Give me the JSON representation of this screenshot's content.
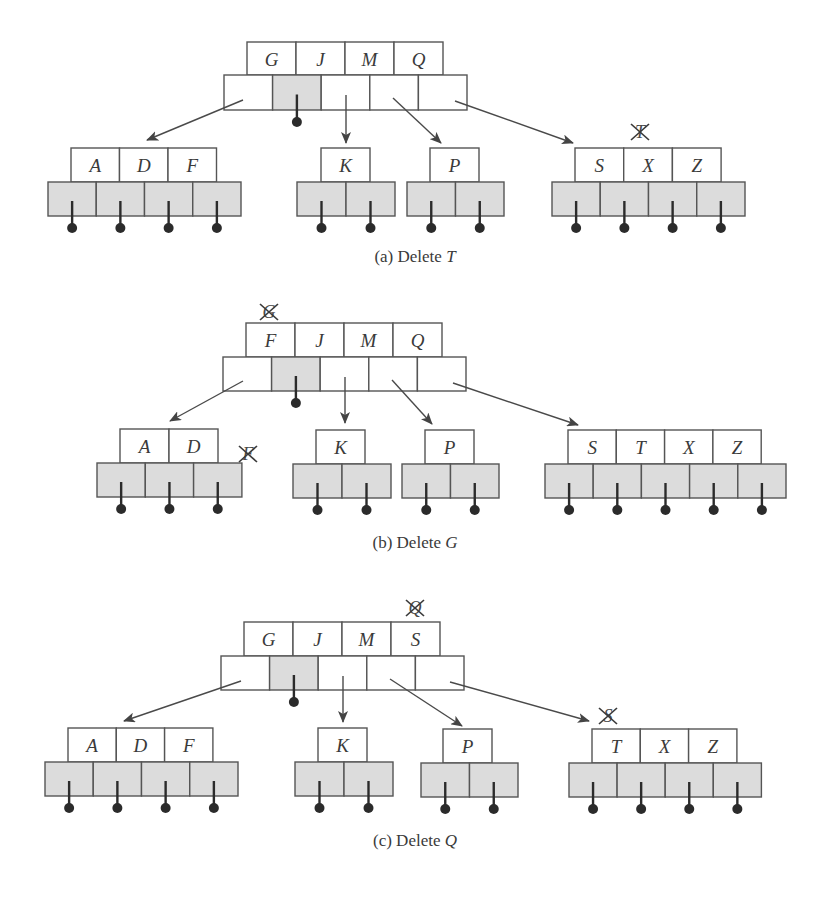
{
  "colors": {
    "line": "#555555",
    "key_fill": "#ffffff",
    "ptr_fill_shaded": "#dcdcdc",
    "ptr_fill_blank": "#ffffff",
    "dot": "#2b2b2b",
    "text": "#3a3a3a"
  },
  "panels": [
    {
      "id": "a",
      "caption": {
        "prefix": "(a) Delete ",
        "var": "T",
        "x": 415,
        "y": 262
      },
      "root": {
        "keys": [
          "G",
          "J",
          "M",
          "Q"
        ],
        "key_x": 247,
        "key_y": 42,
        "key_w": 49,
        "key_h": 33,
        "ptr_x": 224,
        "ptr_y": 75,
        "ptr_w": 48.6,
        "ptr_h": 35,
        "shaded_ptrs": [
          1
        ],
        "null_ptrs": [
          1
        ],
        "struck": null
      },
      "leaves": [
        {
          "keys": [
            "A",
            "D",
            "F"
          ],
          "key_x": 71,
          "key_y": 148,
          "key_w": 48.5,
          "key_h": 34,
          "ptr_x": 48,
          "ptr_y": 182,
          "ptr_w": 48.25,
          "ptr_h": 34,
          "struck": null
        },
        {
          "keys": [
            "K"
          ],
          "key_x": 321,
          "key_y": 148,
          "key_w": 49,
          "key_h": 34,
          "ptr_x": 297,
          "ptr_y": 182,
          "ptr_w": 49,
          "ptr_h": 34,
          "struck": null
        },
        {
          "keys": [
            "P"
          ],
          "key_x": 430,
          "key_y": 148,
          "key_w": 49,
          "key_h": 34,
          "ptr_x": 407,
          "ptr_y": 182,
          "ptr_w": 48.5,
          "ptr_h": 34,
          "struck": null
        },
        {
          "keys": [
            "S",
            "X",
            "Z"
          ],
          "key_x": 575,
          "key_y": 148,
          "key_w": 48.7,
          "key_h": 34,
          "ptr_x": 552,
          "ptr_y": 182,
          "ptr_w": 48.25,
          "ptr_h": 34,
          "struck": {
            "letter": "T",
            "x": 640,
            "y": 132
          }
        }
      ],
      "arrows": [
        {
          "from": [
            243,
            100
          ],
          "to": [
            147,
            140
          ]
        },
        {
          "from": [
            346,
            95
          ],
          "to": [
            346,
            143
          ]
        },
        {
          "from": [
            393,
            98
          ],
          "to": [
            441,
            143
          ]
        },
        {
          "from": [
            455,
            101
          ],
          "to": [
            573,
            143
          ]
        }
      ]
    },
    {
      "id": "b",
      "caption": {
        "prefix": "(b) Delete ",
        "var": "G",
        "x": 415,
        "y": 548
      },
      "root": {
        "keys": [
          "F",
          "J",
          "M",
          "Q"
        ],
        "key_x": 246,
        "key_y": 323,
        "key_w": 49,
        "key_h": 34,
        "ptr_x": 223,
        "ptr_y": 357,
        "ptr_w": 48.6,
        "ptr_h": 34,
        "shaded_ptrs": [
          1
        ],
        "null_ptrs": [
          1
        ],
        "struck": {
          "letter": "G",
          "x": 269,
          "y": 312
        }
      },
      "leaves": [
        {
          "keys": [
            "A",
            "D"
          ],
          "key_x": 120,
          "key_y": 429,
          "key_w": 49,
          "key_h": 34,
          "ptr_x": 97,
          "ptr_y": 463,
          "ptr_w": 48.3,
          "ptr_h": 34,
          "struck": {
            "letter": "F",
            "x": 248,
            "y": 454
          }
        },
        {
          "keys": [
            "K"
          ],
          "key_x": 316,
          "key_y": 430,
          "key_w": 49,
          "key_h": 34,
          "ptr_x": 293,
          "ptr_y": 464,
          "ptr_w": 49,
          "ptr_h": 34,
          "struck": null
        },
        {
          "keys": [
            "P"
          ],
          "key_x": 425,
          "key_y": 430,
          "key_w": 49,
          "key_h": 34,
          "ptr_x": 402,
          "ptr_y": 464,
          "ptr_w": 48.5,
          "ptr_h": 34,
          "struck": null
        },
        {
          "keys": [
            "S",
            "T",
            "X",
            "Z"
          ],
          "key_x": 568,
          "key_y": 430,
          "key_w": 48.3,
          "key_h": 34,
          "ptr_x": 545,
          "ptr_y": 464,
          "ptr_w": 48.2,
          "ptr_h": 34,
          "struck": null
        }
      ],
      "arrows": [
        {
          "from": [
            243,
            381
          ],
          "to": [
            170,
            421
          ]
        },
        {
          "from": [
            345,
            377
          ],
          "to": [
            345,
            423
          ]
        },
        {
          "from": [
            392,
            380
          ],
          "to": [
            432,
            424
          ]
        },
        {
          "from": [
            453,
            383
          ],
          "to": [
            578,
            425
          ]
        }
      ]
    },
    {
      "id": "c",
      "caption": {
        "prefix": "(c) Delete ",
        "var": "Q",
        "x": 415,
        "y": 846
      },
      "root": {
        "keys": [
          "G",
          "J",
          "M",
          "S"
        ],
        "key_x": 244,
        "key_y": 622,
        "key_w": 49,
        "key_h": 34,
        "ptr_x": 221,
        "ptr_y": 656,
        "ptr_w": 48.6,
        "ptr_h": 34,
        "shaded_ptrs": [
          1
        ],
        "null_ptrs": [
          1
        ],
        "struck": {
          "letter": "Q",
          "x": 415,
          "y": 608
        }
      },
      "leaves": [
        {
          "keys": [
            "A",
            "D",
            "F"
          ],
          "key_x": 68,
          "key_y": 728,
          "key_w": 48.3,
          "key_h": 34,
          "ptr_x": 45,
          "ptr_y": 762,
          "ptr_w": 48.25,
          "ptr_h": 34,
          "struck": null
        },
        {
          "keys": [
            "K"
          ],
          "key_x": 318,
          "key_y": 728,
          "key_w": 49,
          "key_h": 34,
          "ptr_x": 295,
          "ptr_y": 762,
          "ptr_w": 49,
          "ptr_h": 34,
          "struck": null
        },
        {
          "keys": [
            "P"
          ],
          "key_x": 443,
          "key_y": 729,
          "key_w": 49,
          "key_h": 34,
          "ptr_x": 421,
          "ptr_y": 763,
          "ptr_w": 48.5,
          "ptr_h": 34,
          "struck": null
        },
        {
          "keys": [
            "T",
            "X",
            "Z"
          ],
          "key_x": 592,
          "key_y": 729,
          "key_w": 48.3,
          "key_h": 34,
          "ptr_x": 569,
          "ptr_y": 763,
          "ptr_w": 48.1,
          "ptr_h": 34,
          "struck": {
            "letter": "S",
            "x": 608,
            "y": 716
          }
        }
      ],
      "arrows": [
        {
          "from": [
            241,
            681
          ],
          "to": [
            124,
            721
          ]
        },
        {
          "from": [
            343,
            676
          ],
          "to": [
            343,
            722
          ]
        },
        {
          "from": [
            390,
            679
          ],
          "to": [
            462,
            726
          ]
        },
        {
          "from": [
            450,
            682
          ],
          "to": [
            589,
            721
          ]
        }
      ]
    }
  ]
}
